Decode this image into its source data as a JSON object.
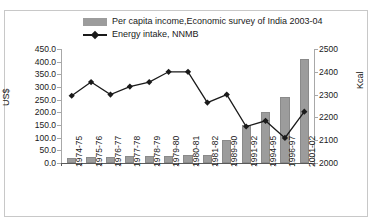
{
  "legend": {
    "items": [
      {
        "label": "Per capita income,Economic survey of India 2003-04",
        "type": "bar",
        "color": "#9c9c9c"
      },
      {
        "label": "Energy intake, NNMB",
        "type": "line",
        "color": "#1a1a1a"
      }
    ]
  },
  "axes": {
    "left_label": "US$",
    "right_label": "Kcal",
    "left_ticks": [
      "450.0",
      "400.0",
      "350.0",
      "300.0",
      "250.0",
      "200.0",
      "150.0",
      "100.0",
      "50.0",
      "0.0"
    ],
    "right_ticks": [
      "2500",
      "2400",
      "2300",
      "2200",
      "2100",
      "2000"
    ]
  },
  "chart_data": {
    "type": "bar",
    "title": "",
    "subtitle": "",
    "xlabel": "",
    "ylabel": "US$",
    "y2label": "Kcal",
    "ylim": [
      0,
      450
    ],
    "y2lim": [
      2000,
      2500
    ],
    "grid": false,
    "legend_position": "top",
    "categories": [
      "1974-75",
      "1975-76",
      "1976-77",
      "1977-78",
      "1978-79",
      "1979-80",
      "1980-81",
      "1981-82",
      "1989-90",
      "1991-92",
      "1994-95",
      "1996-97",
      "2001-02"
    ],
    "series": [
      {
        "name": "Per capita income,Economic survey of India 2003-04",
        "type": "bar",
        "axis": "left",
        "unit": "US$",
        "color": "#9c9c9c",
        "values": [
          20,
          22,
          22,
          26,
          27,
          28,
          32,
          33,
          90,
          150,
          200,
          260,
          410
        ]
      },
      {
        "name": "Energy intake, NNMB",
        "type": "line",
        "axis": "right",
        "unit": "Kcal",
        "color": "#1a1a1a",
        "marker": "diamond",
        "values": [
          2295,
          2355,
          2300,
          2335,
          2355,
          2400,
          2400,
          2265,
          2300,
          2160,
          2185,
          2110,
          2225
        ]
      }
    ]
  }
}
